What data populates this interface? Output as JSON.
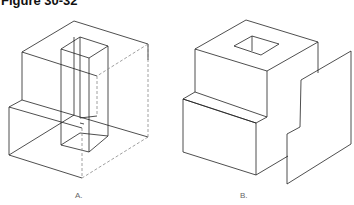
{
  "title": "Figure 30-32",
  "figures": [
    {
      "label": "A.",
      "description": "Wireframe isometric block with vertical rectangular prism cut through, hidden edges dashed"
    },
    {
      "label": "B.",
      "description": "Solid stepped block with square hole on top and a stepped cutting plane on the right"
    }
  ],
  "colors": {
    "line": "#222222",
    "hidden": "#888888"
  }
}
